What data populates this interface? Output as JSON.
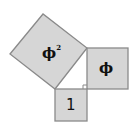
{
  "diagram": {
    "title": "",
    "fill_color": "#d6d6d6",
    "stroke_color": "#8a8a8a",
    "squares": [
      {
        "id": "phi-squared",
        "label": "ϕ",
        "superscript": "2"
      },
      {
        "id": "phi",
        "label": "ϕ"
      },
      {
        "id": "one",
        "label": "1"
      }
    ],
    "right_angle_marker": true
  }
}
